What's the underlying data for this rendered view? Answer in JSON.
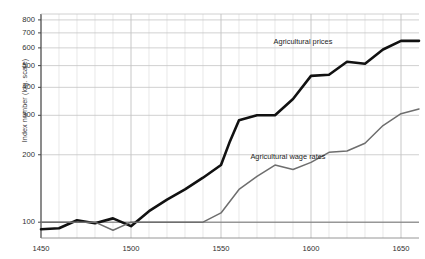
{
  "chart_data": {
    "type": "line",
    "title": "",
    "subtitle": "",
    "xlabel": "",
    "ylabel": "Index number (log. scale)",
    "yscale": "log",
    "xlim": [
      1450,
      1660
    ],
    "ylim": [
      85,
      850
    ],
    "grid": true,
    "grid_x_step": 10,
    "legend_position": "inline-annotation",
    "yticks": [
      100,
      200,
      300,
      400,
      500,
      600,
      700,
      800
    ],
    "ytick_labels": [
      "100",
      "200",
      "300",
      "400",
      "500",
      "600",
      "700",
      "800"
    ],
    "xticks": [
      1450,
      1500,
      1550,
      1600,
      1650
    ],
    "xtick_labels": [
      "1450",
      "1500",
      "1550",
      "1600",
      "1650"
    ],
    "x_minor_ticks": [
      1460,
      1470,
      1480,
      1490,
      1510,
      1520,
      1530,
      1540,
      1560,
      1570,
      1580,
      1590,
      1610,
      1620,
      1630,
      1640
    ],
    "baseline_value": 100,
    "series": [
      {
        "name": "Agricultural prices",
        "color": "#111111",
        "width": 2.6,
        "label_x": 1612,
        "label_y": 640,
        "x": [
          1450,
          1460,
          1470,
          1480,
          1490,
          1500,
          1510,
          1520,
          1530,
          1540,
          1550,
          1555,
          1560,
          1570,
          1580,
          1590,
          1600,
          1610,
          1620,
          1630,
          1640,
          1650,
          1660
        ],
        "values": [
          93,
          94,
          102,
          99,
          104,
          96,
          112,
          126,
          140,
          158,
          180,
          230,
          285,
          300,
          300,
          355,
          450,
          455,
          520,
          510,
          590,
          645,
          645
        ]
      },
      {
        "name": "Agricultural wage rates",
        "color": "#6e6e6e",
        "width": 1.5,
        "label_x": 1608,
        "label_y": 196,
        "x": [
          1450,
          1460,
          1470,
          1480,
          1490,
          1500,
          1510,
          1520,
          1530,
          1540,
          1550,
          1560,
          1570,
          1580,
          1590,
          1600,
          1610,
          1620,
          1630,
          1640,
          1650,
          1660
        ],
        "values": [
          100,
          100,
          100,
          100,
          92,
          100,
          100,
          100,
          100,
          100,
          110,
          140,
          160,
          180,
          172,
          185,
          205,
          208,
          225,
          270,
          305,
          320
        ]
      }
    ],
    "annotations": [
      {
        "text": "Agricultural prices",
        "x": 1612,
        "y": 640
      },
      {
        "text": "Agricultural wage rates",
        "x": 1608,
        "y": 196
      }
    ]
  }
}
